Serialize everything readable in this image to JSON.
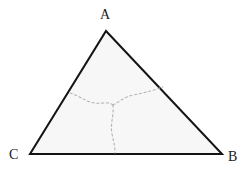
{
  "figure": {
    "canvas": {
      "width": 250,
      "height": 173,
      "background": "#ffffff"
    },
    "triangle": {
      "name": "triangle-ABC",
      "fill": "#f7f7f7",
      "stroke": "#141414",
      "stroke_width": 2,
      "vertices": [
        {
          "label": "A",
          "x": 106,
          "y": 31
        },
        {
          "label": "B",
          "x": 222,
          "y": 154
        },
        {
          "label": "C",
          "x": 30,
          "y": 154
        }
      ],
      "path": "M 106 31 L 222 154 L 30 154 Z"
    },
    "labels": {
      "apex": "A",
      "bottom_right": "B",
      "bottom_left": "C"
    },
    "dashed_curves": {
      "stroke": "#b4b4b4",
      "stroke_width": 1.1,
      "dash_pattern": "2.2 2.6",
      "junction": {
        "x": 113,
        "y": 105
      },
      "branches": [
        {
          "name": "branch-to-side-AC",
          "from": {
            "x": 70,
            "y": 93
          },
          "to": {
            "x": 113,
            "y": 105
          },
          "path": "M 70 93 C 80 96, 86 102, 95 103 C 102 104, 108 101, 113 105"
        },
        {
          "name": "branch-to-side-AB",
          "from": {
            "x": 113,
            "y": 105
          },
          "to": {
            "x": 163,
            "y": 87
          },
          "path": "M 113 105 C 119 102, 124 97, 133 95 C 143 93, 148 92, 163 87"
        },
        {
          "name": "branch-to-side-CB",
          "from": {
            "x": 113,
            "y": 105
          },
          "to": {
            "x": 115,
            "y": 153
          },
          "path": "M 113 105 C 114 116, 110 124, 112 134 C 114 143, 115 147, 115 153"
        }
      ]
    }
  }
}
